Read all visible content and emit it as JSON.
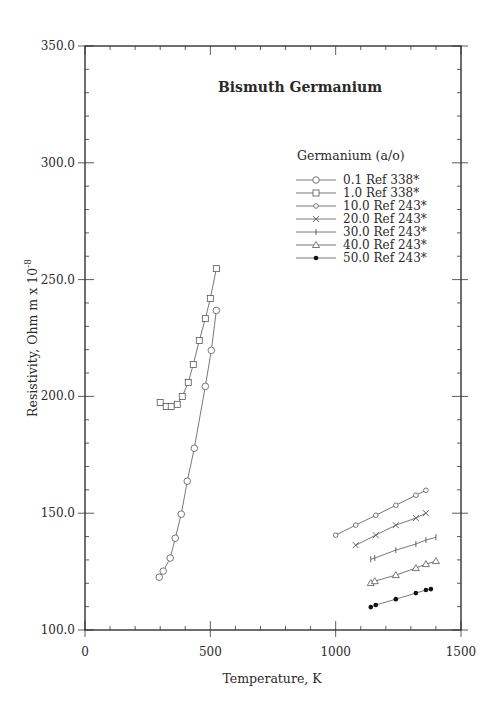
{
  "chart_data": {
    "type": "scatter",
    "title": "Bismuth Germanium",
    "xlabel": "Temperature,  K",
    "ylabel": "Resistivity, Ohm m x 10",
    "ylabel_exponent": "-8",
    "xlim": [
      0,
      1500
    ],
    "ylim": [
      100,
      350
    ],
    "x_ticks": [
      0,
      500,
      1000,
      1500
    ],
    "x_tick_labels": [
      "0",
      "500",
      "1000",
      "1500"
    ],
    "y_ticks": [
      100,
      150,
      200,
      250,
      300,
      350
    ],
    "y_tick_labels": [
      "100.0",
      "150.0",
      "200.0",
      "250.0",
      "300.0",
      "350.0"
    ],
    "x_minor_step": 100,
    "y_minor_step": 10,
    "grid": false,
    "legend_title": "Germanium (a/o)",
    "legend_position": "upper-right-inside",
    "series": [
      {
        "name": "0.1 Ref 338*",
        "marker": "circle",
        "x": [
          296,
          312,
          340,
          360,
          384,
          408,
          436,
          480,
          504,
          524
        ],
        "y": [
          122.6,
          125.2,
          130.8,
          139.3,
          149.6,
          163.7,
          177.8,
          204.3,
          219.7,
          236.8
        ]
      },
      {
        "name": "1.0 Ref 338*",
        "marker": "square",
        "x": [
          300,
          324,
          344,
          368,
          388,
          412,
          432,
          456,
          480,
          500,
          524
        ],
        "y": [
          197.4,
          195.7,
          195.7,
          196.6,
          200.0,
          206.0,
          213.7,
          223.9,
          233.3,
          241.9,
          254.7
        ]
      },
      {
        "name": "10.0 Ref 243*",
        "marker": "diamond",
        "x": [
          1000,
          1080,
          1160,
          1240,
          1320,
          1360
        ],
        "y": [
          140.6,
          144.9,
          149.1,
          153.4,
          157.7,
          159.8
        ]
      },
      {
        "name": "20.0 Ref 243*",
        "marker": "x",
        "x": [
          1080,
          1160,
          1240,
          1320,
          1360
        ],
        "y": [
          136.3,
          140.6,
          144.9,
          147.9,
          150.0
        ]
      },
      {
        "name": "30.0 Ref 243*",
        "marker": "plus",
        "x": [
          1140,
          1156,
          1240,
          1320,
          1360,
          1400
        ],
        "y": [
          130.3,
          130.8,
          134.2,
          136.8,
          138.5,
          139.7
        ]
      },
      {
        "name": "40.0 Ref 243*",
        "marker": "triangle",
        "x": [
          1140,
          1156,
          1240,
          1320,
          1360,
          1400
        ],
        "y": [
          120.1,
          120.9,
          123.5,
          126.5,
          128.2,
          129.5
        ]
      },
      {
        "name": "50.0 Ref 243*",
        "marker": "dot",
        "x": [
          1140,
          1160,
          1240,
          1320,
          1360,
          1380
        ],
        "y": [
          109.8,
          110.7,
          113.2,
          115.8,
          117.1,
          117.5
        ]
      }
    ]
  },
  "style": {
    "line_color": "#555555",
    "axis_color": "#333333",
    "marker_fill_open": "#ffffff",
    "marker_fill_solid": "#111111"
  }
}
